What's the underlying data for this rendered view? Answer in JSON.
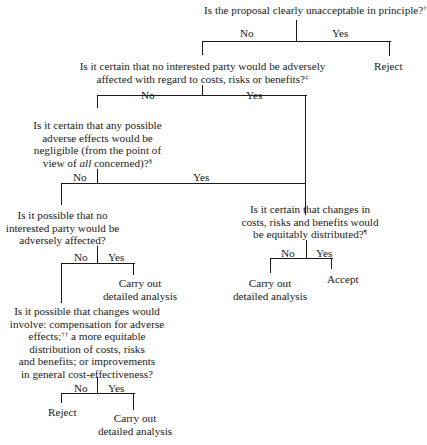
{
  "diagram": {
    "type": "decision-tree",
    "questions": {
      "q1": {
        "text": "Is the proposal clearly unacceptable in principle?",
        "mark": "†"
      },
      "q2": {
        "line1": "Is it certain that no interested party would be adversely",
        "line2": "affected with regard to costs, risks or benefits?",
        "mark": "‡"
      },
      "q3": {
        "line1": "Is it certain that any possible",
        "line2": "adverse effects would be",
        "line3": "negligible (from the point of",
        "line4a": "view of ",
        "line4_em": "all",
        "line4b": " concerned)?",
        "mark": "§"
      },
      "q4": {
        "line1": "Is it possible that no",
        "line2": "interested party would be",
        "line3": "adversely affected?"
      },
      "q5": {
        "line1": "Is it certain that changes in",
        "line2": "costs, risks and benefits would",
        "line3": "be equitably distributed?",
        "mark": "¶"
      },
      "q6": {
        "line1": "Is it possible that changes would",
        "line2": "involve: compensation for adverse",
        "line3a": "effects;",
        "line3_mark": "††",
        "line3b": " a more equitable",
        "line4": "distribution of costs, risks",
        "line5": "and benefits; or improvements",
        "line6": "in general cost-effectiveness?"
      }
    },
    "branch_labels": {
      "no": "No",
      "yes": "Yes"
    },
    "outcomes": {
      "reject": "Reject",
      "accept": "Accept",
      "analysis_line1": "Carry out",
      "analysis_line2": "detailed analysis"
    }
  }
}
